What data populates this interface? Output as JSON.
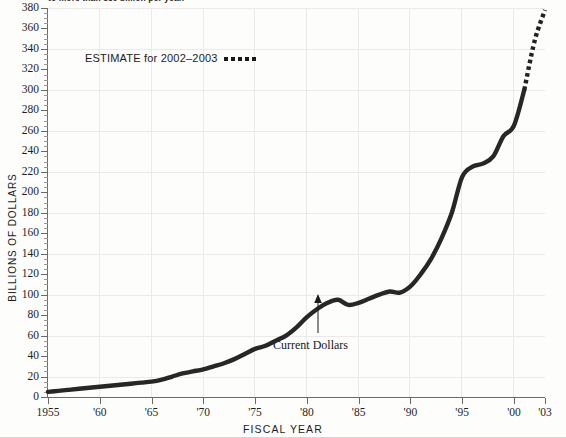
{
  "caption": {
    "top_text": "to more than 350 billion per year."
  },
  "axis": {
    "y_title": "BILLIONS OF DOLLARS",
    "x_title": "FISCAL YEAR",
    "y_ticks": [
      0,
      20,
      40,
      60,
      80,
      100,
      120,
      140,
      160,
      180,
      200,
      220,
      240,
      260,
      280,
      300,
      320,
      340,
      360,
      380
    ],
    "x_ticks": [
      "1955",
      "'60",
      "'65",
      "'70",
      "'75",
      "'80",
      "'85",
      "'90",
      "'95",
      "'00",
      "'03"
    ]
  },
  "legend": {
    "estimate_label": "ESTIMATE for 2002–2003",
    "estimate_swatch": "dotted-line-swatch"
  },
  "annotations": {
    "current_dollars": "Current Dollars"
  },
  "colors": {
    "line": "#272727",
    "grid": "#eceae6",
    "axis": "#6d6a66",
    "text": "#1b1b1b",
    "background": "#fdfdfc"
  },
  "chart_data": {
    "type": "line",
    "title": "",
    "xlabel": "FISCAL YEAR",
    "ylabel": "BILLIONS OF DOLLARS",
    "xlim": [
      1955,
      2003
    ],
    "ylim": [
      0,
      380
    ],
    "grid": true,
    "legend_position": "upper-left",
    "y_tick_interval": 20,
    "y_minor_tick_interval": 5,
    "x_tick_interval": 5,
    "series": [
      {
        "name": "Current Dollars",
        "style": "solid",
        "x": [
          1955,
          1956,
          1957,
          1958,
          1959,
          1960,
          1961,
          1962,
          1963,
          1964,
          1965,
          1966,
          1967,
          1968,
          1969,
          1970,
          1971,
          1972,
          1973,
          1974,
          1975,
          1976,
          1977,
          1978,
          1979,
          1980,
          1981,
          1982,
          1983,
          1984,
          1985,
          1986,
          1987,
          1988,
          1989,
          1990,
          1991,
          1992,
          1993,
          1994,
          1995,
          1996,
          1997,
          1998,
          1999,
          2000,
          2001
        ],
        "values": [
          5,
          6,
          7,
          8,
          9,
          10,
          11,
          12,
          13,
          14,
          15,
          17,
          20,
          23,
          25,
          27,
          30,
          33,
          37,
          42,
          47,
          50,
          55,
          60,
          68,
          78,
          86,
          92,
          95,
          90,
          92,
          96,
          100,
          103,
          102,
          108,
          120,
          135,
          155,
          180,
          215,
          225,
          228,
          235,
          255,
          265,
          300
        ],
        "value_unit": "billions of dollars"
      },
      {
        "name": "ESTIMATE for 2002–2003",
        "style": "dotted",
        "x": [
          2001,
          2002,
          2003
        ],
        "values": [
          300,
          348,
          378
        ],
        "value_unit": "billions of dollars"
      }
    ]
  }
}
